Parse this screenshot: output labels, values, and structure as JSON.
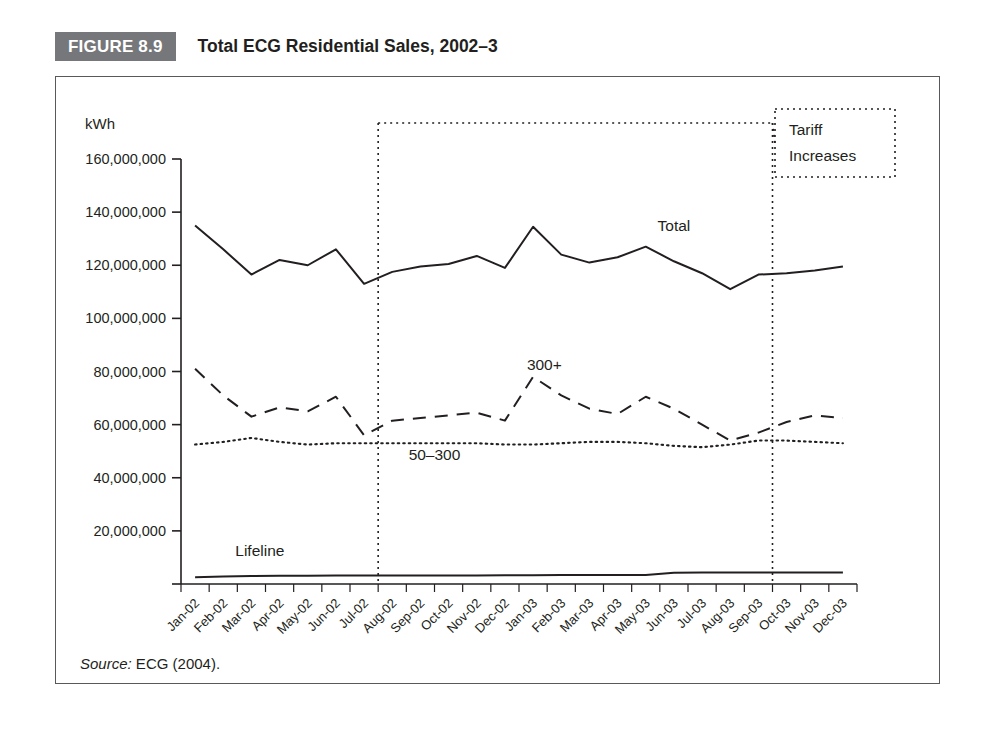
{
  "figure": {
    "badge": "FIGURE 8.9",
    "title": "Total ECG Residential Sales, 2002–3",
    "source_lead": "Source:",
    "source_text": " ECG (2004)."
  },
  "annotations": {
    "tariff_line1": "Tariff",
    "tariff_line2": "Increases"
  },
  "colors": {
    "badge_bg": "#76777a",
    "ink": "#231f20",
    "frame": "#58595b",
    "line": "#231f20"
  },
  "chart_data": {
    "type": "line",
    "title": "Total ECG Residential Sales, 2002–3",
    "xlabel": "",
    "ylabel": "kWh",
    "ylim": [
      0,
      160000000
    ],
    "ytick_values": [
      0,
      20000000,
      40000000,
      60000000,
      80000000,
      100000000,
      120000000,
      140000000,
      160000000
    ],
    "ytick_labels": [
      "",
      "20,000,000",
      "40,000,000",
      "60,000,000",
      "80,000,000",
      "100,000,000",
      "120,000,000",
      "140,000,000",
      "160,000,000"
    ],
    "grid": false,
    "legend_position": "inline-labels",
    "categories": [
      "Jan-02",
      "Feb-02",
      "Mar-02",
      "Apr-02",
      "May-02",
      "Jun-02",
      "Jul-02",
      "Aug-02",
      "Sep-02",
      "Oct-02",
      "Nov-02",
      "Dec-02",
      "Jan-03",
      "Feb-03",
      "Mar-03",
      "Apr-03",
      "May-03",
      "Jun-03",
      "Jul-03",
      "Aug-03",
      "Sep-03",
      "Oct-03",
      "Nov-03",
      "Dec-03"
    ],
    "series": [
      {
        "name": "Total",
        "style": "solid",
        "label_x_index": 17.0,
        "label_y_value": 133000000,
        "values": [
          135000000,
          126000000,
          116500000,
          122000000,
          120000000,
          126000000,
          113000000,
          117500000,
          119500000,
          120500000,
          123500000,
          119000000,
          134500000,
          124000000,
          121000000,
          123000000,
          127000000,
          121500000,
          117000000,
          111000000,
          116500000,
          117000000,
          118000000,
          119500000
        ]
      },
      {
        "name": "300+",
        "style": "dashed",
        "label_x_index": 12.4,
        "label_y_value": 80500000,
        "values": [
          81000000,
          71000000,
          63000000,
          66500000,
          65000000,
          70500000,
          56000000,
          61500000,
          62500000,
          63500000,
          64500000,
          61500000,
          78000000,
          71000000,
          66000000,
          64000000,
          70500000,
          66000000,
          60000000,
          54000000,
          57000000,
          61000000,
          63500000,
          62500000
        ]
      },
      {
        "name": "50–300",
        "style": "dotted",
        "label_x_index": 8.5,
        "label_y_value": 46500000,
        "values": [
          52500000,
          53500000,
          55000000,
          53500000,
          52500000,
          53000000,
          53000000,
          53000000,
          53000000,
          53000000,
          53000000,
          52500000,
          52500000,
          53000000,
          53500000,
          53500000,
          53000000,
          52000000,
          51500000,
          52500000,
          54000000,
          54000000,
          53500000,
          53000000
        ]
      },
      {
        "name": "Lifeline",
        "style": "solid",
        "label_x_index": 2.3,
        "label_y_value": 10500000,
        "values": [
          2500000,
          2800000,
          3000000,
          3100000,
          3100000,
          3200000,
          3200000,
          3200000,
          3200000,
          3200000,
          3200000,
          3300000,
          3300000,
          3400000,
          3400000,
          3400000,
          3400000,
          4200000,
          4300000,
          4300000,
          4300000,
          4300000,
          4300000,
          4300000
        ]
      }
    ],
    "annotations": [
      {
        "name": "tariff-increase-marker-1",
        "x_index": 6,
        "label": "Tariff Increases"
      },
      {
        "name": "tariff-increase-marker-2",
        "x_index": 20,
        "label": "Tariff Increases"
      }
    ]
  }
}
